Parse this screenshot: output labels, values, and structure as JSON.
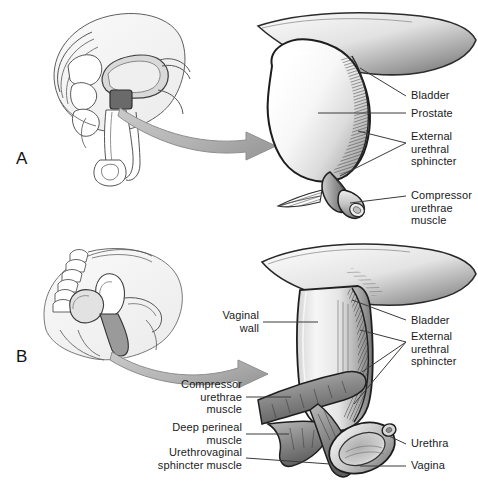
{
  "figure": {
    "background_color": "#ffffff",
    "text_color": "#1a1a1a",
    "arrow_color": "#9a9a9a",
    "leader_color": "#3a3a3a"
  },
  "panels": [
    {
      "letter": "A",
      "subject": "male",
      "inset_caption": "male-pelvis-sagittal-sketch",
      "main_caption": "bladder-prostate-enlarged-view",
      "labels": [
        {
          "id": "bladder",
          "text": "Bladder"
        },
        {
          "id": "prostate",
          "text": "Prostate"
        },
        {
          "id": "external-urethral-sphincter",
          "text": "External\nurethral\nsphincter"
        },
        {
          "id": "compressor-urethrae-muscle",
          "text": "Compressor\nurethrae\nmuscle"
        }
      ]
    },
    {
      "letter": "B",
      "subject": "female",
      "inset_caption": "female-pelvis-sagittal-sketch",
      "main_caption": "vagina-urethra-enlarged-view",
      "labels": [
        {
          "id": "vaginal-wall",
          "text": "Vaginal\nwall"
        },
        {
          "id": "bladder",
          "text": "Bladder"
        },
        {
          "id": "external-urethral-sphincter",
          "text": "External\nurethral\nsphincter"
        },
        {
          "id": "compressor-urethrae-muscle",
          "text": "Compressor\nurethrae\nmuscle"
        },
        {
          "id": "deep-perineal-muscle",
          "text": "Deep perineal\nmuscle"
        },
        {
          "id": "urethrovaginal-sphincter-muscle",
          "text": "Urethrovaginal\nsphincter muscle"
        },
        {
          "id": "urethra",
          "text": "Urethra"
        },
        {
          "id": "vagina",
          "text": "Vagina"
        }
      ]
    }
  ]
}
